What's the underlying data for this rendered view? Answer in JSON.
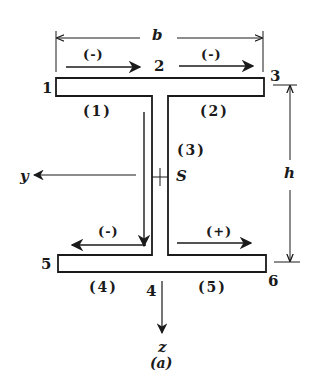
{
  "figure": {
    "caption": "(a)",
    "section": "I-beam (symmetric)",
    "colors": {
      "ink": "#1a1a1a",
      "background": "#ffffff"
    }
  },
  "dimensions": {
    "width_label": "b",
    "height_label": "h"
  },
  "axes": {
    "y_label": "y",
    "z_label": "z",
    "shear_center_label": "S"
  },
  "points": {
    "p1": "1",
    "p2": "2",
    "p3": "3",
    "p4": "4",
    "p5": "5",
    "p6": "6"
  },
  "segments": {
    "s1": "(1)",
    "s2": "(2)",
    "s3": "(3)",
    "s4": "(4)",
    "s5": "(5)"
  },
  "flow_signs": {
    "top_left": "(-)",
    "top_right": "(-)",
    "bottom_left": "(-)",
    "bottom_right": "(+)"
  }
}
